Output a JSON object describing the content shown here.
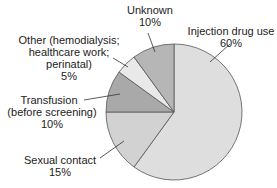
{
  "chart_data": {
    "type": "pie",
    "title": "",
    "categories": [
      "Injection drug use",
      "Sexual contact",
      "Transfusion (before screening)",
      "Other (hemodialysis; healthcare work; perinatal)",
      "Unknown"
    ],
    "values": [
      60,
      15,
      10,
      5,
      10
    ],
    "unit": "%",
    "colors": [
      "#dedede",
      "#d2d2d2",
      "#a9a9a9",
      "#e9e9e9",
      "#b6b6b6"
    ]
  },
  "labels": {
    "injection": {
      "name": "Injection drug use",
      "pct": "60%"
    },
    "sexual": {
      "name": "Sexual contact",
      "pct": "15%"
    },
    "transfusion": {
      "line1": "Transfusion",
      "line2": "(before screening)",
      "pct": "10%"
    },
    "other": {
      "line1": "Other (hemodialysis;",
      "line2": "healthcare work;",
      "line3": "perinatal)",
      "pct": "5%"
    },
    "unknown": {
      "name": "Unknown",
      "pct": "10%"
    }
  }
}
